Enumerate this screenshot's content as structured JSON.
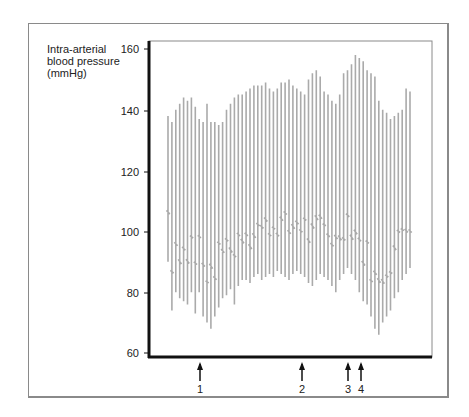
{
  "chart_data": {
    "type": "line",
    "title": "",
    "ylabel_lines": [
      "Intra-arterial",
      "blood pressure",
      "(mmHg)"
    ],
    "xlabel": "",
    "ylim": [
      60,
      160
    ],
    "yticks": [
      160,
      140,
      120,
      100,
      80,
      60
    ],
    "grid": false,
    "legend": null,
    "color": "#aaaaaa",
    "series": [
      {
        "name": "Systolic peaks (mmHg)",
        "values": [
          138,
          136,
          140,
          142,
          144,
          143,
          144,
          141,
          137,
          136,
          142,
          136,
          136,
          135,
          136,
          140,
          142,
          144,
          145,
          145,
          146,
          147,
          148,
          148,
          148,
          149,
          147,
          146,
          147,
          149,
          149,
          150,
          148,
          147,
          146,
          145,
          150,
          152,
          153,
          151,
          146,
          145,
          143,
          142,
          145,
          152,
          153,
          155,
          158,
          157,
          156,
          153,
          152,
          151,
          143,
          140,
          139,
          137,
          138,
          139,
          140,
          147,
          146
        ]
      },
      {
        "name": "Diastolic troughs (mmHg)",
        "values": [
          90,
          74,
          80,
          78,
          77,
          76,
          80,
          73,
          80,
          72,
          70,
          68,
          72,
          75,
          78,
          79,
          81,
          76,
          82,
          84,
          84,
          83,
          85,
          86,
          84,
          85,
          86,
          85,
          87,
          86,
          85,
          84,
          86,
          87,
          86,
          85,
          83,
          82,
          84,
          86,
          85,
          84,
          82,
          80,
          84,
          86,
          88,
          86,
          84,
          80,
          77,
          76,
          72,
          68,
          66,
          70,
          72,
          74,
          78,
          80,
          84,
          86,
          88
        ]
      }
    ],
    "events": [
      {
        "label": "1",
        "x_px": 200
      },
      {
        "label": "2",
        "x_px": 303
      },
      {
        "label": "3",
        "x_px": 348
      },
      {
        "label": "4",
        "x_px": 361
      }
    ]
  },
  "ylabel": {
    "line1": "Intra-arterial",
    "line2": "blood pressure",
    "line3": "(mmHg)"
  },
  "yticks": {
    "t160": "160",
    "t140": "140",
    "t120": "120",
    "t100": "100",
    "t80": "80",
    "t60": "60"
  },
  "events": {
    "e1": "1",
    "e2": "2",
    "e3": "3",
    "e4": "4"
  }
}
